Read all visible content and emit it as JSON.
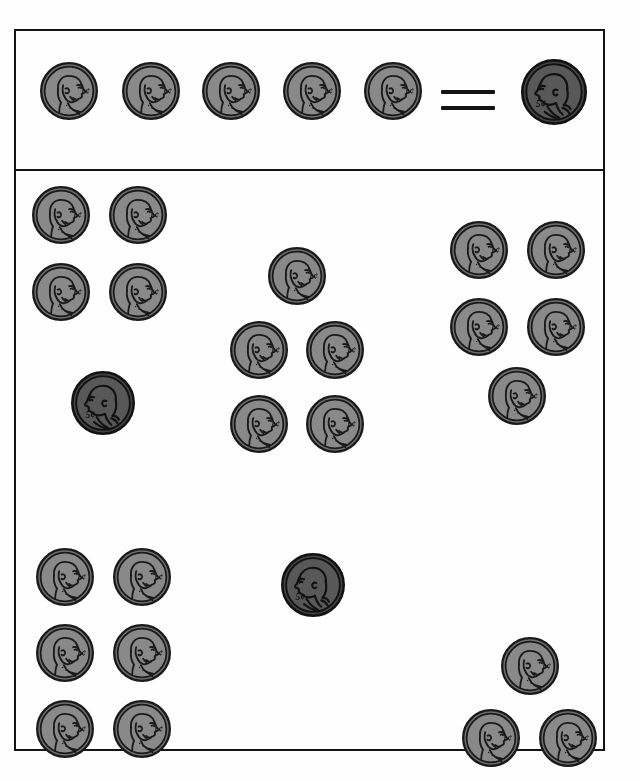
{
  "worksheet": {
    "title": "Counting Coins — Pennies and Nickels",
    "coin_types": {
      "penny": {
        "name": "penny",
        "label": "1¢",
        "value_cents": 1,
        "face_color": "#8a8a8a",
        "rim_color": "#6f6f6f",
        "line_color": "#1a1a1a",
        "diameter_px": 58
      },
      "nickel": {
        "name": "nickel",
        "label": "5¢",
        "value_cents": 5,
        "face_color": "#585858",
        "rim_color": "#444444",
        "line_color": "#121212",
        "diameter_px": 64
      }
    },
    "key": {
      "name": "equivalence-key",
      "left_coins": [
        {
          "type": "penny",
          "label": "1¢",
          "x": 24,
          "y": 31,
          "size": 58
        },
        {
          "type": "penny",
          "label": "1¢",
          "x": 106,
          "y": 31,
          "size": 58
        },
        {
          "type": "penny",
          "label": "1¢",
          "x": 186,
          "y": 31,
          "size": 58
        },
        {
          "type": "penny",
          "label": "1¢",
          "x": 267,
          "y": 31,
          "size": 58
        },
        {
          "type": "penny",
          "label": "1¢",
          "x": 348,
          "y": 31,
          "size": 58
        }
      ],
      "operator": {
        "name": "equals-sign",
        "symbol": "=",
        "x": 425,
        "y": 57
      },
      "right_coins": [
        {
          "type": "nickel",
          "label": "5¢",
          "x": 505,
          "y": 28,
          "size": 66
        }
      ]
    },
    "groups": [
      {
        "name": "group-row1-left",
        "position": "top-left",
        "penny_count": 4,
        "nickel_count": 1,
        "total_cents": 9,
        "coins": [
          {
            "type": "penny",
            "label": "1¢",
            "x": 16,
            "y": 15,
            "size": 58
          },
          {
            "type": "penny",
            "label": "1¢",
            "x": 93,
            "y": 15,
            "size": 58
          },
          {
            "type": "penny",
            "label": "1¢",
            "x": 16,
            "y": 92,
            "size": 58
          },
          {
            "type": "penny",
            "label": "1¢",
            "x": 93,
            "y": 92,
            "size": 58
          },
          {
            "type": "nickel",
            "label": "5¢",
            "x": 55,
            "y": 200,
            "size": 64
          }
        ]
      },
      {
        "name": "group-row1-center",
        "position": "top-center",
        "penny_count": 5,
        "nickel_count": 0,
        "total_cents": 5,
        "coins": [
          {
            "type": "penny",
            "label": "1¢",
            "x": 252,
            "y": 76,
            "size": 58
          },
          {
            "type": "penny",
            "label": "1¢",
            "x": 214,
            "y": 150,
            "size": 58
          },
          {
            "type": "penny",
            "label": "1¢",
            "x": 290,
            "y": 150,
            "size": 58
          },
          {
            "type": "penny",
            "label": "1¢",
            "x": 214,
            "y": 224,
            "size": 58
          },
          {
            "type": "penny",
            "label": "1¢",
            "x": 290,
            "y": 224,
            "size": 58
          }
        ]
      },
      {
        "name": "group-row1-right",
        "position": "top-right",
        "penny_count": 5,
        "nickel_count": 0,
        "total_cents": 5,
        "coins": [
          {
            "type": "penny",
            "label": "1¢",
            "x": 434,
            "y": 50,
            "size": 58
          },
          {
            "type": "penny",
            "label": "1¢",
            "x": 511,
            "y": 50,
            "size": 58
          },
          {
            "type": "penny",
            "label": "1¢",
            "x": 434,
            "y": 127,
            "size": 58
          },
          {
            "type": "penny",
            "label": "1¢",
            "x": 511,
            "y": 127,
            "size": 58
          },
          {
            "type": "penny",
            "label": "1¢",
            "x": 472,
            "y": 196,
            "size": 58
          }
        ]
      },
      {
        "name": "group-row2-left",
        "position": "bottom-left",
        "penny_count": 6,
        "nickel_count": 0,
        "total_cents": 6,
        "coins": [
          {
            "type": "penny",
            "label": "1¢",
            "x": 20,
            "y": 377,
            "size": 58
          },
          {
            "type": "penny",
            "label": "1¢",
            "x": 97,
            "y": 377,
            "size": 58
          },
          {
            "type": "penny",
            "label": "1¢",
            "x": 20,
            "y": 453,
            "size": 58
          },
          {
            "type": "penny",
            "label": "1¢",
            "x": 97,
            "y": 453,
            "size": 58
          },
          {
            "type": "penny",
            "label": "1¢",
            "x": 20,
            "y": 529,
            "size": 58
          },
          {
            "type": "penny",
            "label": "1¢",
            "x": 97,
            "y": 529,
            "size": 58
          }
        ]
      },
      {
        "name": "group-row2-center",
        "position": "bottom-center",
        "penny_count": 0,
        "nickel_count": 1,
        "total_cents": 5,
        "coins": [
          {
            "type": "nickel",
            "label": "5¢",
            "x": 265,
            "y": 382,
            "size": 64
          }
        ]
      },
      {
        "name": "group-row2-right",
        "position": "bottom-right",
        "penny_count": 3,
        "nickel_count": 0,
        "total_cents": 3,
        "coins": [
          {
            "type": "penny",
            "label": "1¢",
            "x": 485,
            "y": 466,
            "size": 58
          },
          {
            "type": "penny",
            "label": "1¢",
            "x": 446,
            "y": 538,
            "size": 58
          },
          {
            "type": "penny",
            "label": "1¢",
            "x": 523,
            "y": 538,
            "size": 58
          }
        ]
      }
    ]
  }
}
